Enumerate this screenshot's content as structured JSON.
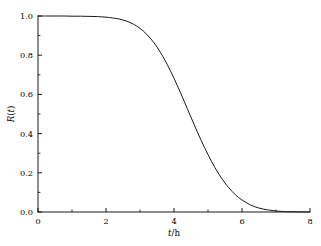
{
  "chart_data": {
    "type": "line",
    "title": "",
    "subtitle": "",
    "xlabel": "t/h",
    "ylabel": "R(t)",
    "xlabel_parts": {
      "variable": "t",
      "separator": "/",
      "unit": "h"
    },
    "ylabel_parts": {
      "symbol": "R",
      "open": "(",
      "variable": "t",
      "close": ")"
    },
    "xlim": [
      0,
      8
    ],
    "ylim": [
      0,
      1
    ],
    "grid": false,
    "legend": null,
    "legend_position": "none",
    "background_color": "#ffffff",
    "line_color": "#1a1a1a",
    "line_width": 1.0,
    "axis_color": "#000000",
    "spines": [
      "left",
      "bottom"
    ],
    "tick_direction": "in",
    "xticks": [
      0,
      2,
      4,
      6,
      8
    ],
    "xtick_labels": [
      "0",
      "2",
      "4",
      "6",
      "8"
    ],
    "xminorticks": [
      1,
      3,
      5,
      7
    ],
    "yticks": [
      0.0,
      0.2,
      0.4,
      0.6,
      0.8,
      1.0
    ],
    "ytick_labels": [
      "0.0",
      "0.2",
      "0.4",
      "0.6",
      "0.8",
      "1.0"
    ],
    "yminorticks": [
      0.1,
      0.3,
      0.5,
      0.7,
      0.9
    ],
    "series": [
      {
        "name": "R(t)",
        "x": [
          0.0,
          0.25,
          0.5,
          0.75,
          1.0,
          1.25,
          1.5,
          1.75,
          2.0,
          2.2,
          2.4,
          2.6,
          2.8,
          3.0,
          3.2,
          3.4,
          3.6,
          3.8,
          4.0,
          4.2,
          4.4,
          4.6,
          4.8,
          5.0,
          5.2,
          5.4,
          5.6,
          5.8,
          6.0,
          6.25,
          6.5,
          6.75,
          7.0,
          7.25,
          7.5,
          7.75,
          8.0
        ],
        "y": [
          1.0,
          1.0,
          1.0,
          1.0,
          0.999,
          0.999,
          0.998,
          0.997,
          0.994,
          0.99,
          0.984,
          0.974,
          0.959,
          0.937,
          0.906,
          0.866,
          0.815,
          0.753,
          0.682,
          0.605,
          0.524,
          0.443,
          0.365,
          0.293,
          0.228,
          0.172,
          0.126,
          0.089,
          0.061,
          0.036,
          0.02,
          0.011,
          0.005,
          0.002,
          0.001,
          0.0005,
          0.0002
        ]
      }
    ],
    "annotations": []
  }
}
